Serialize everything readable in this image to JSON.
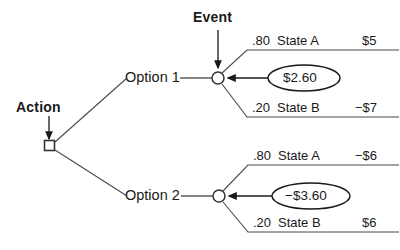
{
  "diagram": {
    "type": "decision-tree",
    "background_color": "#ffffff",
    "line_color": "#333333",
    "text_color": "#1a1a1a",
    "labels": {
      "action": "Action",
      "event": "Event"
    },
    "decision_node": {
      "shape": "square",
      "name": "action-node"
    },
    "branches": [
      {
        "option_label": "Option 1",
        "chance_node_shape": "circle",
        "expected_value": "$2.60",
        "outcomes": [
          {
            "probability": ".80",
            "state": "State A",
            "payoff": "$5"
          },
          {
            "probability": ".20",
            "state": "State B",
            "payoff": "−$7"
          }
        ]
      },
      {
        "option_label": "Option 2",
        "chance_node_shape": "circle",
        "expected_value": "−$3.60",
        "outcomes": [
          {
            "probability": ".80",
            "state": "State A",
            "payoff": "−$6"
          },
          {
            "probability": ".20",
            "state": "State B",
            "payoff": "$6"
          }
        ]
      }
    ]
  }
}
